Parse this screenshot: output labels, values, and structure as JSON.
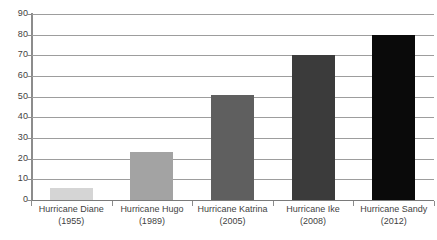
{
  "chart_data": {
    "type": "bar",
    "title": "",
    "subtitle": "",
    "xlabel": "",
    "ylabel": "",
    "categories": [
      "Hurricane Diane\n(1955)",
      "Hurricane Hugo\n(1989)",
      "Hurricane Katrina\n(2005)",
      "Hurricane Ike\n(2008)",
      "Hurricane Sandy\n(2012)"
    ],
    "category_names": [
      "Hurricane Diane",
      "Hurricane Hugo",
      "Hurricane Katrina",
      "Hurricane Ike",
      "Hurricane Sandy"
    ],
    "category_years": [
      "(1955)",
      "(1989)",
      "(2005)",
      "(2008)",
      "(2012)"
    ],
    "values": [
      6,
      23,
      51,
      70,
      80
    ],
    "bar_colors": [
      "#d5d5d5",
      "#a3a3a3",
      "#5f5f5f",
      "#3b3b3b",
      "#0a0a0a"
    ],
    "ylim": [
      0,
      90
    ],
    "ytick_values": [
      0,
      10,
      20,
      30,
      40,
      50,
      60,
      70,
      80,
      90
    ],
    "ytick_labels": [
      "0",
      "10",
      "20",
      "30",
      "40",
      "50",
      "60",
      "70",
      "80",
      "90"
    ],
    "ytick_interval": 10,
    "grid": true,
    "grid_axis": "y",
    "grid_color": "#9d9d9d",
    "legend": false,
    "legend_position": "none",
    "axis_color": "#8c8c8c",
    "background_color": "#ffffff",
    "text_color": "#3f3f3f",
    "annotations": []
  },
  "bars": [
    {
      "name": "Hurricane Diane",
      "year": "(1955)",
      "value": 6,
      "color": "#d5d5d5"
    },
    {
      "name": "Hurricane Hugo",
      "year": "(1989)",
      "value": 23,
      "color": "#a3a3a3"
    },
    {
      "name": "Hurricane Katrina",
      "year": "(2005)",
      "value": 51,
      "color": "#5f5f5f"
    },
    {
      "name": "Hurricane Ike",
      "year": "(2008)",
      "value": 70,
      "color": "#3b3b3b"
    },
    {
      "name": "Hurricane Sandy",
      "year": "(2012)",
      "value": 80,
      "color": "#0a0a0a"
    }
  ]
}
